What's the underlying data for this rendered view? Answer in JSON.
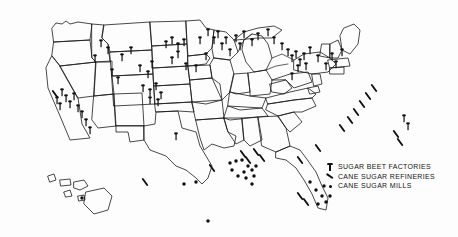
{
  "figure": {
    "kind": "thematic-map",
    "region": "United States",
    "background_color": "#fdfdfd",
    "line_color": "#1a1a1a",
    "symbol_color": "#101010",
    "width": 458,
    "height": 237
  },
  "legend": {
    "position": "bottom-right",
    "items": [
      {
        "symbol": "pin-icon",
        "label": "SUGAR BEET FACTORIES"
      },
      {
        "symbol": "slash-icon",
        "label": "CANE SUGAR REFINERIES"
      },
      {
        "symbol": "dot-icon",
        "label": "CANE SUGAR MILLS"
      }
    ]
  },
  "map_markers": {
    "sugar_beet_factories": [
      [
        95,
        62
      ],
      [
        101,
        47
      ],
      [
        108,
        54
      ],
      [
        112,
        76
      ],
      [
        118,
        84
      ],
      [
        122,
        61
      ],
      [
        131,
        54
      ],
      [
        140,
        72
      ],
      [
        148,
        78
      ],
      [
        152,
        68
      ],
      [
        143,
        92
      ],
      [
        150,
        96
      ],
      [
        156,
        90
      ],
      [
        161,
        99
      ],
      [
        158,
        106
      ],
      [
        150,
        104
      ],
      [
        62,
        96
      ],
      [
        66,
        102
      ],
      [
        70,
        108
      ],
      [
        74,
        100
      ],
      [
        78,
        112
      ],
      [
        82,
        118
      ],
      [
        86,
        126
      ],
      [
        90,
        134
      ],
      [
        57,
        104
      ],
      [
        60,
        110
      ],
      [
        166,
        48
      ],
      [
        172,
        44
      ],
      [
        178,
        50
      ],
      [
        184,
        46
      ],
      [
        178,
        58
      ],
      [
        172,
        64
      ],
      [
        186,
        70
      ],
      [
        196,
        72
      ],
      [
        206,
        60
      ],
      [
        214,
        44
      ],
      [
        218,
        38
      ],
      [
        222,
        50
      ],
      [
        226,
        44
      ],
      [
        230,
        56
      ],
      [
        236,
        42
      ],
      [
        240,
        50
      ],
      [
        244,
        38
      ],
      [
        252,
        46
      ],
      [
        258,
        40
      ],
      [
        288,
        56
      ],
      [
        292,
        62
      ],
      [
        296,
        58
      ],
      [
        300,
        66
      ],
      [
        304,
        60
      ],
      [
        298,
        72
      ],
      [
        306,
        70
      ],
      [
        292,
        80
      ],
      [
        176,
        140
      ],
      [
        208,
        36
      ],
      [
        200,
        44
      ],
      [
        268,
        36
      ],
      [
        274,
        44
      ],
      [
        282,
        50
      ],
      [
        310,
        54
      ],
      [
        318,
        62
      ],
      [
        326,
        70
      ],
      [
        332,
        60
      ],
      [
        336,
        68
      ],
      [
        342,
        56
      ],
      [
        404,
        122
      ],
      [
        408,
        130
      ]
    ],
    "cane_sugar_refineries": [
      [
        55,
        94
      ],
      [
        212,
        168
      ],
      [
        243,
        154
      ],
      [
        248,
        160
      ],
      [
        256,
        152
      ],
      [
        262,
        158
      ],
      [
        300,
        160
      ],
      [
        318,
        148
      ],
      [
        342,
        128
      ],
      [
        350,
        120
      ],
      [
        356,
        112
      ],
      [
        362,
        104
      ],
      [
        368,
        96
      ],
      [
        374,
        88
      ],
      [
        300,
        196
      ],
      [
        306,
        202
      ],
      [
        396,
        134
      ],
      [
        400,
        142
      ],
      [
        145,
        182
      ]
    ],
    "cane_sugar_mills": [
      [
        196,
        182
      ],
      [
        230,
        163
      ],
      [
        236,
        161
      ],
      [
        242,
        160
      ],
      [
        248,
        166
      ],
      [
        252,
        170
      ],
      [
        256,
        166
      ],
      [
        244,
        172
      ],
      [
        238,
        176
      ],
      [
        232,
        170
      ],
      [
        246,
        178
      ],
      [
        254,
        176
      ],
      [
        252,
        184
      ],
      [
        208,
        221
      ],
      [
        184,
        184
      ],
      [
        310,
        182
      ],
      [
        316,
        190
      ],
      [
        322,
        196
      ],
      [
        318,
        204
      ],
      [
        326,
        202
      ],
      [
        330,
        196
      ],
      [
        324,
        186
      ],
      [
        82,
        198
      ]
    ]
  },
  "insets": {
    "hawaii": {
      "label": "",
      "marker_count": 1
    },
    "alaska": {
      "label": "",
      "marker_count": 0
    }
  }
}
